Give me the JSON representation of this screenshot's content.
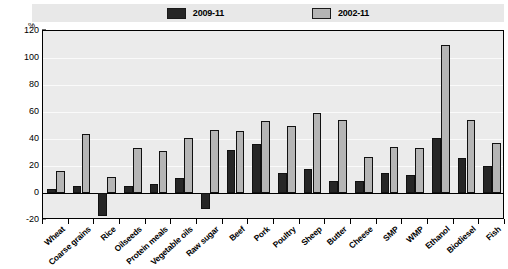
{
  "chart_data": {
    "type": "bar",
    "title": "",
    "subtitle": "",
    "xlabel": "",
    "ylabel": "%",
    "ylim": [
      -20,
      120
    ],
    "yticks": [
      -20,
      0,
      20,
      40,
      60,
      80,
      100,
      120
    ],
    "grid": true,
    "legend_position": "top",
    "categories": [
      "Wheat",
      "Coarse grains",
      "Rice",
      "Oilseeds",
      "Protein meals",
      "Vegetable oils",
      "Raw sugar",
      "Beef",
      "Pork",
      "Poultry",
      "Sheep",
      "Butter",
      "Cheese",
      "SMP",
      "WMP",
      "Ethanol",
      "Biodiesel",
      "Fish"
    ],
    "series": [
      {
        "name": "2009-11",
        "color": "#262626",
        "values": [
          3,
          5,
          -17,
          5,
          7,
          11,
          -12,
          32,
          36,
          15,
          18,
          9,
          9,
          15,
          13,
          41,
          26,
          20
        ]
      },
      {
        "name": "2002-11",
        "color": "#b5b5b5",
        "values": [
          16,
          44,
          12,
          33,
          31,
          41,
          47,
          46,
          53,
          50,
          59,
          54,
          27,
          34,
          33,
          110,
          54,
          37
        ]
      }
    ]
  },
  "legend": {
    "items": [
      {
        "label": "2009-11",
        "swatch": "dark"
      },
      {
        "label": "2002-11",
        "swatch": "light"
      }
    ]
  },
  "axis": {
    "unit": "%"
  }
}
